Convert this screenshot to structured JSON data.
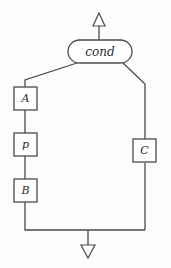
{
  "diagram": {
    "type": "flowchart",
    "background_color": "#fdfdfd",
    "line_color": "#4a4a4a",
    "node_fill_color": "#ffffff",
    "label_color": "#2b2b2b",
    "nodes": [
      {
        "id": "cond",
        "label": "cond",
        "shape": "rounded-capsule",
        "x": 68,
        "y": 40,
        "width": 64,
        "height": 23,
        "branch": "decision"
      },
      {
        "id": "a",
        "label": "A",
        "shape": "square",
        "x": 14,
        "y": 87,
        "width": 23,
        "height": 23,
        "branch": "left"
      },
      {
        "id": "p",
        "label": "p",
        "shape": "square",
        "x": 14,
        "y": 133,
        "width": 23,
        "height": 23,
        "branch": "left"
      },
      {
        "id": "b",
        "label": "B",
        "shape": "square",
        "x": 14,
        "y": 179,
        "width": 23,
        "height": 23,
        "branch": "left"
      },
      {
        "id": "c",
        "label": "C",
        "shape": "square",
        "x": 133,
        "y": 139,
        "width": 23,
        "height": 23,
        "branch": "right"
      }
    ],
    "arrows": [
      {
        "id": "entry-arrow",
        "direction": "up",
        "style": "hollow-triangle",
        "x": 99,
        "y": 14,
        "label": ""
      },
      {
        "id": "exit-arrow",
        "direction": "down",
        "style": "hollow-triangle",
        "x": 88,
        "y": 244,
        "label": ""
      }
    ],
    "edges": [
      {
        "id": "cond-to-top-arrow",
        "from": "cond",
        "to": "entry-arrow"
      },
      {
        "id": "cond-to-left-branch",
        "from": "cond",
        "to": "a"
      },
      {
        "id": "a-to-p",
        "from": "a",
        "to": "p"
      },
      {
        "id": "p-to-b",
        "from": "p",
        "to": "b"
      },
      {
        "id": "cond-to-right-branch",
        "from": "cond",
        "to": "c"
      },
      {
        "id": "b-to-join",
        "from": "b",
        "to": "exit-arrow"
      },
      {
        "id": "c-to-join",
        "from": "c",
        "to": "exit-arrow"
      }
    ]
  }
}
